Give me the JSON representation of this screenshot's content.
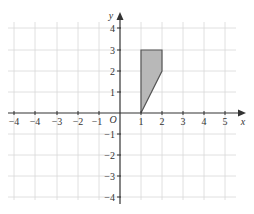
{
  "diagram": {
    "type": "coordinate-grid",
    "axes": {
      "x_label": "x",
      "y_label": "y",
      "origin_label": "O",
      "x_ticks": [
        {
          "value": -5,
          "label": "−4"
        },
        {
          "value": -4,
          "label": "−4"
        },
        {
          "value": -3,
          "label": "−3"
        },
        {
          "value": -2,
          "label": "−2"
        },
        {
          "value": -1,
          "label": "−1"
        },
        {
          "value": 1,
          "label": "1"
        },
        {
          "value": 2,
          "label": "2"
        },
        {
          "value": 3,
          "label": "3"
        },
        {
          "value": 4,
          "label": "4"
        },
        {
          "value": 5,
          "label": "5"
        }
      ],
      "y_ticks": [
        {
          "value": 4,
          "label": "4"
        },
        {
          "value": 3,
          "label": "3"
        },
        {
          "value": 2,
          "label": "2"
        },
        {
          "value": 1,
          "label": "1"
        },
        {
          "value": -1,
          "label": "−1"
        },
        {
          "value": -2,
          "label": "−2"
        },
        {
          "value": -3,
          "label": "−3"
        },
        {
          "value": -4,
          "label": "−4"
        }
      ]
    },
    "shape": {
      "name": "shaded-quadrilateral",
      "vertices": [
        [
          1,
          0
        ],
        [
          1,
          3
        ],
        [
          2,
          3
        ],
        [
          2,
          2
        ]
      ],
      "fill": "#b5b5b5",
      "stroke": "#555555"
    },
    "colors": {
      "grid": "#d4d4d4",
      "axis": "#333333"
    }
  }
}
